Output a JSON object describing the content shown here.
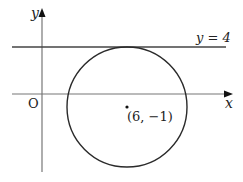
{
  "diagram": {
    "type": "coordinate-geometry",
    "axes": {
      "x_label": "x",
      "y_label": "y",
      "origin_label": "O"
    },
    "line": {
      "equation_label": "y = 4",
      "y_value": 4
    },
    "circle": {
      "center_label": "(6, −1)",
      "center": [
        6,
        -1
      ],
      "tangent_to": "y = 4"
    },
    "colors": {
      "axis": "#777777",
      "curve": "#2a2a2a",
      "line": "#444444"
    }
  }
}
